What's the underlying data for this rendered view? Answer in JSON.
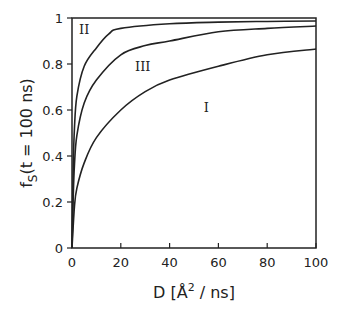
{
  "chart_data": {
    "type": "line",
    "title": "",
    "xlabel": "D [Å² / ns]",
    "xlabel_main": "D [Å",
    "xlabel_sup": "2",
    "xlabel_tail": " / ns]",
    "ylabel": "f_S(t = 100 ns)",
    "ylabel_main": "f",
    "ylabel_sub": "S",
    "ylabel_tail": "(t = 100 ns)",
    "xlim": [
      0,
      100
    ],
    "ylim": [
      0,
      1
    ],
    "xticks": [
      0,
      20,
      40,
      60,
      80,
      100
    ],
    "xtick_labels": [
      "0",
      "20",
      "40",
      "60",
      "80",
      "100"
    ],
    "yticks": [
      0,
      0.2,
      0.4,
      0.6,
      0.8,
      1
    ],
    "ytick_labels": [
      "0",
      "0.2",
      "0.4",
      "0.6",
      "0.8",
      "1"
    ],
    "grid": false,
    "legend": "none",
    "series": [
      {
        "name": "I",
        "x": [
          0,
          1,
          2,
          5,
          10,
          20,
          30,
          40,
          60,
          80,
          100
        ],
        "y": [
          0,
          0.18,
          0.26,
          0.37,
          0.48,
          0.6,
          0.68,
          0.73,
          0.79,
          0.84,
          0.865
        ]
      },
      {
        "name": "II",
        "x": [
          0,
          0.5,
          1,
          2,
          5,
          10,
          15,
          20,
          40,
          60,
          80,
          100
        ],
        "y": [
          0,
          0.35,
          0.52,
          0.66,
          0.79,
          0.87,
          0.93,
          0.955,
          0.975,
          0.982,
          0.985,
          0.987
        ]
      },
      {
        "name": "III",
        "x": [
          0,
          0.5,
          1,
          2,
          5,
          10,
          20,
          30,
          40,
          60,
          80,
          100
        ],
        "y": [
          0,
          0.22,
          0.36,
          0.49,
          0.63,
          0.73,
          0.84,
          0.88,
          0.9,
          0.94,
          0.955,
          0.965
        ]
      }
    ],
    "annotations": [
      {
        "text": "II",
        "x": 5,
        "y": 0.93
      },
      {
        "text": "III",
        "x": 29,
        "y": 0.77
      },
      {
        "text": "I",
        "x": 55,
        "y": 0.59
      }
    ]
  }
}
